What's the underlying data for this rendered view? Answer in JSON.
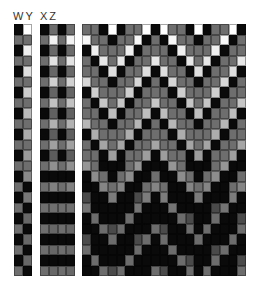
{
  "labels": {
    "left_block": "WY",
    "middle_block": "XZ"
  },
  "colors": {
    "black": "#0a0a0a",
    "dark_gray": "#4a4a4a",
    "gray": "#6e6e6e",
    "light_gray": "#9a9a9a",
    "white": "#ffffff"
  },
  "blocks": {
    "wy": {
      "columns": 2,
      "rows": 24,
      "description": "column W alternates black/gray; column Y alternates white/gray fading to dark toward bottom"
    },
    "xz": {
      "columns": 4,
      "rows": 24,
      "description": "checkerboard of black, gray and white fading to darker toward bottom"
    },
    "main": {
      "columns": 19,
      "rows": 24,
      "description": "staggered checker pattern with white cells in upper rows fading to dark gray/black at bottom, zigzag wave pattern"
    }
  }
}
